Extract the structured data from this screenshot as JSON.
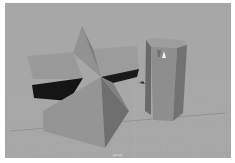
{
  "viewport": {
    "camera_label": "persp",
    "background_color": "#a7a7a7",
    "grid_color": "#b8b8b8",
    "objects": [
      {
        "name": "star-pyramid",
        "type": "polygon-star"
      },
      {
        "name": "hexagonal-prism",
        "type": "polygon-cylinder"
      }
    ],
    "manipulator": "move-tool-arrow"
  }
}
